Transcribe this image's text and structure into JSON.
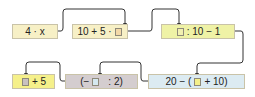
{
  "diagram": {
    "title": "",
    "boxes": [
      {
        "id": "b1",
        "pre": "4 · x",
        "post": "",
        "placeholder": false,
        "bg": "#f7f0c6"
      },
      {
        "id": "b2",
        "pre": "10 + 5 ·",
        "post": "",
        "placeholder": true,
        "ph_color": "#f3d9a8",
        "bg": "#f7f0c6"
      },
      {
        "id": "b3",
        "pre": "",
        "post": ": 10 − 1",
        "placeholder": true,
        "ph_color": "#f2f0b0",
        "bg": "#eff2a6"
      },
      {
        "id": "b4",
        "pre": "",
        "post": "+ 5",
        "placeholder": true,
        "ph_color": "#c9c1bf",
        "bg": "#f5f08a"
      },
      {
        "id": "b5",
        "pre": "(−",
        "post": ": 2)",
        "placeholder": true,
        "ph_color": "#d5e8ef",
        "bg": "#d4cdcf"
      },
      {
        "id": "b6",
        "pre": "20 − (",
        "post": "+ 10)",
        "placeholder": true,
        "ph_color": "#f4f08a",
        "bg": "#dcebf2"
      }
    ],
    "arrows": [
      {
        "from": "b1",
        "to": "b2"
      },
      {
        "from": "b2",
        "to": "b3"
      },
      {
        "from": "b3",
        "to": "b6"
      },
      {
        "from": "b6",
        "to": "b5"
      },
      {
        "from": "b5",
        "to": "b4"
      }
    ],
    "colors": {
      "line": "#333333"
    }
  }
}
